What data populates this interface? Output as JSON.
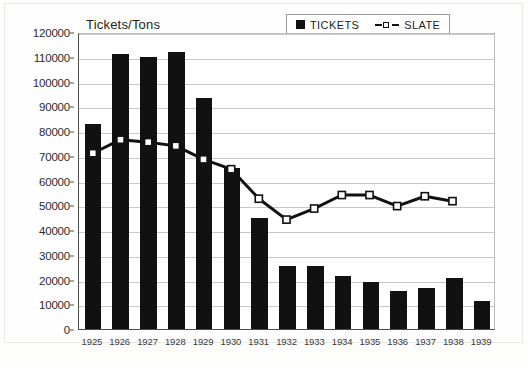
{
  "chart_data": {
    "type": "bar",
    "title": "Tickets/Tons",
    "xlabel": "",
    "ylabel": "",
    "ylim": [
      0,
      120000
    ],
    "ytick_step": 10000,
    "yticks": [
      "0",
      "10000",
      "20000",
      "30000",
      "40000",
      "50000",
      "60000",
      "70000",
      "80000",
      "90000",
      "100000",
      "110000",
      "120000"
    ],
    "grid": true,
    "legend_position": "top-right",
    "categories": [
      "1925",
      "1926",
      "1927",
      "1928",
      "1929",
      "1930",
      "1931",
      "1932",
      "1933",
      "1934",
      "1935",
      "1936",
      "1937",
      "1938",
      "1939"
    ],
    "series": [
      {
        "name": "TICKETS",
        "type": "bar",
        "color": "#111111",
        "values": [
          83000,
          111000,
          110000,
          112000,
          93500,
          65000,
          45000,
          25500,
          25500,
          21500,
          19000,
          15500,
          16500,
          20500,
          11500
        ]
      },
      {
        "name": "SLATE",
        "type": "line",
        "color": "#111111",
        "marker": "white-square",
        "linestyle": "dashed",
        "values": [
          71500,
          77000,
          76000,
          74500,
          69000,
          65000,
          53000,
          44500,
          49000,
          54500,
          54500,
          50000,
          54000,
          52000,
          null
        ]
      }
    ]
  },
  "legend": {
    "items": [
      {
        "label": "TICKETS",
        "marker": "filled-square"
      },
      {
        "label": "SLATE",
        "marker": "dashed-line-square"
      }
    ]
  }
}
